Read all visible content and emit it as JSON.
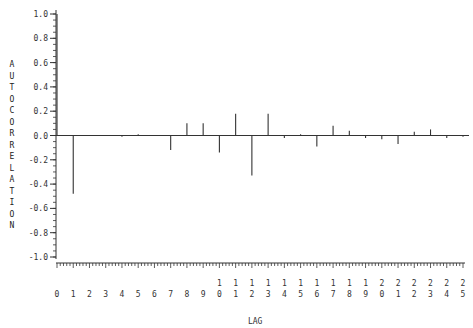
{
  "chart_data": {
    "type": "bar",
    "title": "",
    "xlabel": "LAG",
    "ylabel": "AUTOCORRELATION",
    "ylim": [
      -1.0,
      1.0
    ],
    "yticks": [
      "1.0",
      "0.8",
      "0.6",
      "0.4",
      "0.2",
      "0.0",
      "-0.2",
      "-0.4",
      "-0.6",
      "-0.8",
      "-1.0"
    ],
    "xticks": [
      "0",
      "1",
      "2",
      "3",
      "4",
      "5",
      "6",
      "7",
      "8",
      "9",
      "10",
      "11",
      "12",
      "13",
      "14",
      "15",
      "16",
      "17",
      "18",
      "19",
      "20",
      "21",
      "22",
      "23",
      "24",
      "25"
    ],
    "categories": [
      0,
      1,
      2,
      3,
      4,
      5,
      6,
      7,
      8,
      9,
      10,
      11,
      12,
      13,
      14,
      15,
      16,
      17,
      18,
      19,
      20,
      21,
      22,
      23,
      24,
      25
    ],
    "values": [
      1.0,
      -0.48,
      0.0,
      0.0,
      -0.01,
      0.01,
      0.0,
      -0.12,
      0.1,
      0.1,
      -0.14,
      0.18,
      -0.33,
      0.18,
      -0.02,
      0.01,
      -0.09,
      0.08,
      0.04,
      -0.02,
      -0.03,
      -0.07,
      0.03,
      0.05,
      -0.02,
      -0.01
    ],
    "grid": false,
    "legend": null
  }
}
